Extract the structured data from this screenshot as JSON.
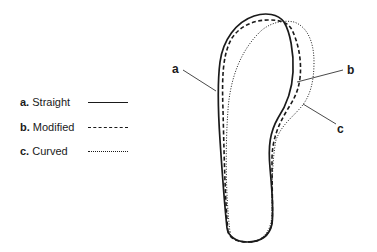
{
  "legend": {
    "items": [
      {
        "key": "a.",
        "label": "Straight",
        "style": "solid"
      },
      {
        "key": "b.",
        "label": "Modified",
        "style": "dashed"
      },
      {
        "key": "c.",
        "label": "Curved",
        "style": "dotted"
      }
    ]
  },
  "diagram": {
    "callouts": [
      {
        "id": "a",
        "text": "a"
      },
      {
        "id": "b",
        "text": "b"
      },
      {
        "id": "c",
        "text": "c"
      }
    ],
    "line_color": "#1a1a1a"
  }
}
